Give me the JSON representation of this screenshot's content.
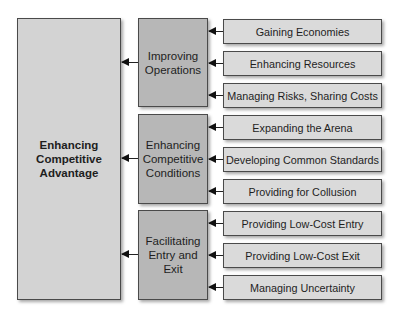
{
  "diagram": {
    "root": {
      "label_lines": [
        "Enhancing",
        "Competitive",
        "Advantage"
      ]
    },
    "groups": [
      {
        "label_lines": [
          "Improving",
          "Operations"
        ],
        "items": [
          "Gaining Economies",
          "Enhancing Resources",
          "Managing Risks, Sharing Costs"
        ]
      },
      {
        "label_lines": [
          "Enhancing",
          "Competitive",
          "Conditions"
        ],
        "items": [
          "Expanding the Arena",
          "Developing Common Standards",
          "Providing for Collusion"
        ]
      },
      {
        "label_lines": [
          "Facilitating",
          "Entry and",
          "Exit"
        ],
        "items": [
          "Providing Low-Cost Entry",
          "Providing Low-Cost Exit",
          "Managing Uncertainty"
        ]
      }
    ],
    "colors": {
      "root_fill": "#d3d3d3",
      "group_fill": "#b7b7b7",
      "item_fill": "#dadada",
      "border": "#4a4a4a",
      "arrow": "#111111"
    }
  }
}
